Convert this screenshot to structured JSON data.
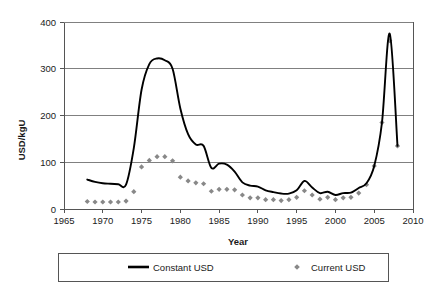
{
  "chart_data": {
    "type": "line",
    "title": "",
    "xlabel": "Year",
    "ylabel": "USD/kgU",
    "xlim": [
      1965,
      2010
    ],
    "ylim": [
      0,
      400
    ],
    "xticks": [
      1965,
      1970,
      1975,
      1980,
      1985,
      1990,
      1995,
      2000,
      2005,
      2010
    ],
    "yticks": [
      0,
      100,
      200,
      300,
      400
    ],
    "grid": "horizontal",
    "legend_position": "below",
    "series": [
      {
        "name": "Constant USD",
        "type": "line",
        "color": "#000000",
        "x": [
          1968,
          1969,
          1970,
          1971,
          1972,
          1973,
          1974,
          1975,
          1976,
          1977,
          1978,
          1979,
          1980,
          1981,
          1982,
          1983,
          1984,
          1985,
          1986,
          1987,
          1988,
          1989,
          1990,
          1991,
          1992,
          1993,
          1994,
          1995,
          1996,
          1997,
          1998,
          1999,
          2000,
          2001,
          2002,
          2003,
          2004,
          2005,
          2006,
          2007,
          2008
        ],
        "values": [
          63,
          58,
          55,
          54,
          53,
          52,
          130,
          255,
          310,
          322,
          318,
          300,
          215,
          160,
          138,
          135,
          88,
          97,
          95,
          80,
          57,
          50,
          48,
          40,
          36,
          33,
          33,
          40,
          60,
          46,
          34,
          37,
          30,
          34,
          35,
          45,
          55,
          92,
          185,
          375,
          135
        ]
      },
      {
        "name": "Current USD",
        "type": "scatter",
        "color": "#888888",
        "marker": "diamond",
        "x": [
          1968,
          1969,
          1970,
          1971,
          1972,
          1973,
          1974,
          1975,
          1976,
          1977,
          1978,
          1979,
          1980,
          1981,
          1982,
          1983,
          1984,
          1985,
          1986,
          1987,
          1988,
          1989,
          1990,
          1991,
          1992,
          1993,
          1994,
          1995,
          1996,
          1997,
          1998,
          1999,
          2000,
          2001,
          2002,
          2003,
          2004,
          2005,
          2006,
          2007,
          2008
        ],
        "values": [
          16,
          15,
          15,
          15,
          15,
          17,
          37,
          90,
          104,
          112,
          112,
          103,
          68,
          60,
          56,
          54,
          38,
          42,
          42,
          41,
          30,
          24,
          24,
          20,
          20,
          18,
          20,
          25,
          39,
          30,
          21,
          25,
          20,
          24,
          25,
          34,
          52,
          92,
          185,
          360,
          135
        ]
      }
    ]
  },
  "legend": {
    "entries": [
      {
        "label": "Constant USD",
        "marker": "line",
        "color": "#000000"
      },
      {
        "label": "Current USD",
        "marker": "diamond",
        "color": "#888888"
      }
    ]
  }
}
